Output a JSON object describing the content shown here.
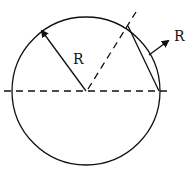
{
  "diagram": {
    "type": "geometry",
    "colors": {
      "stroke": "#111111",
      "background": "#ffffff"
    },
    "circle": {
      "cx": 86,
      "cy": 91,
      "r": 74
    },
    "labels": {
      "radius_label": "R",
      "chord_arrow_label": "R"
    }
  }
}
